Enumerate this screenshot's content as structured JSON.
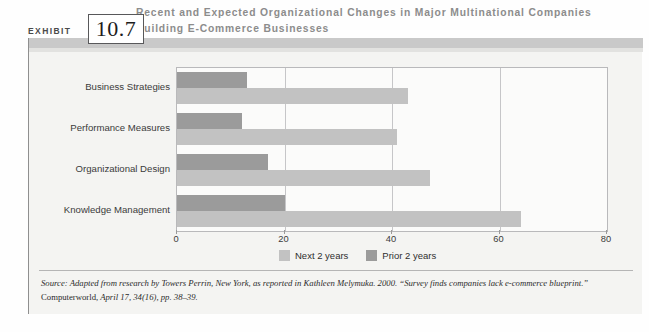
{
  "exhibit": {
    "word": "EXHIBIT",
    "number": "10.7"
  },
  "title": "Recent and Expected Organizational Changes in Major Multinational Companies Building E-Commerce Businesses",
  "source": {
    "label": "Source:",
    "line1": " Adapted from research by Towers Perrin, New York, as reported in Kathleen Melymuka. 2000. “Survey finds companies lack e-commerce blueprint.” ",
    "journal": "Computerworld",
    "line2": ", April 17, 34(16), pp. 38–39."
  },
  "colors": {
    "prior": "#9b9b9b",
    "next": "#c2c2c2",
    "band": "#c9c9c9",
    "panel": "#f4f4f2",
    "title_text": "#8c8c8c"
  },
  "chart_data": {
    "type": "bar",
    "orientation": "horizontal",
    "title": "Recent and Expected Organizational Changes in Major Multinational Companies Building E-Commerce Businesses",
    "categories": [
      "Business Strategies",
      "Performance Measures",
      "Organizational Design",
      "Knowledge Management"
    ],
    "series": [
      {
        "name": "Prior 2 years",
        "values": [
          13,
          12,
          17,
          20
        ]
      },
      {
        "name": "Next 2 years",
        "values": [
          43,
          41,
          47,
          64
        ]
      }
    ],
    "series_order_top_to_bottom": [
      "Prior 2 years",
      "Next 2 years"
    ],
    "xlabel": "",
    "ylabel": "",
    "xlim": [
      0,
      80
    ],
    "xticks": [
      0,
      20,
      40,
      60,
      80
    ],
    "xticklabels": [
      "0",
      "20",
      "40",
      "60",
      "80"
    ],
    "grid": true,
    "grid_axis": "x",
    "legend": [
      "Next 2 years",
      "Prior 2 years"
    ],
    "legend_position": "bottom"
  }
}
